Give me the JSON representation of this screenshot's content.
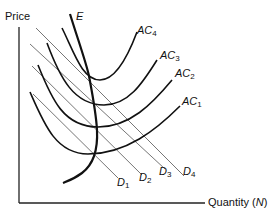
{
  "diagram": {
    "type": "economics-cost-demand-diagram",
    "axes": {
      "y_label": "Price",
      "x_label": "Quantity (",
      "x_label_var": "N",
      "x_label_close": ")"
    },
    "curves": {
      "E": {
        "label": "E"
      },
      "AC": [
        {
          "label": "AC",
          "sub": "4"
        },
        {
          "label": "AC",
          "sub": "3"
        },
        {
          "label": "AC",
          "sub": "2"
        },
        {
          "label": "AC",
          "sub": "1"
        }
      ],
      "D": [
        {
          "label": "D",
          "sub": "1"
        },
        {
          "label": "D",
          "sub": "2"
        },
        {
          "label": "D",
          "sub": "3"
        },
        {
          "label": "D",
          "sub": "4"
        }
      ]
    },
    "colors": {
      "axis": "#222222",
      "curve": "#111111",
      "demand_line": "#666666"
    }
  }
}
